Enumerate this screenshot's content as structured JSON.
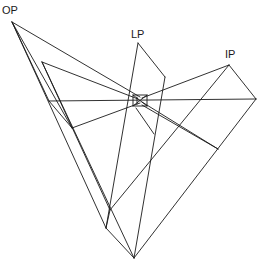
{
  "diagram": {
    "type": "projection geometry diagram",
    "labels": {
      "op": "OP",
      "lp": "LP",
      "ip": "IP"
    },
    "points": {
      "OP": [
        12,
        22
      ],
      "LP": [
        138,
        43
      ],
      "LP2": [
        165,
        77
      ],
      "IP": [
        229,
        65
      ],
      "R": [
        256,
        99
      ],
      "A": [
        42,
        62
      ],
      "B": [
        49,
        101
      ],
      "C": [
        72,
        128
      ],
      "BOX": [
        140,
        101
      ],
      "D": [
        218,
        149
      ],
      "E": [
        106,
        228
      ],
      "F": [
        110,
        210
      ],
      "BOTTOM": [
        134,
        258
      ]
    },
    "colors": {
      "line": "#1a1a1a",
      "background": "#ffffff"
    }
  }
}
